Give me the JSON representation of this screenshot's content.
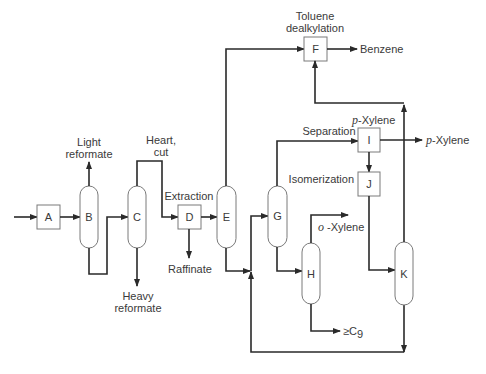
{
  "diagram": {
    "type": "process-flow",
    "units": {
      "A": "A",
      "B": "B",
      "C": "C",
      "D": "D",
      "E": "E",
      "F": "F",
      "G": "G",
      "H": "H",
      "I": "I",
      "J": "J",
      "K": "K"
    },
    "labels": {
      "light_reformate_1": "Light",
      "light_reformate_2": "reformate",
      "heart_cut_1": "Heart,",
      "heart_cut_2": "cut",
      "heavy_reformate_1": "Heavy",
      "heavy_reformate_2": "reformate",
      "extraction": "Extraction",
      "raffinate": "Raffinate",
      "toluene_dealkylation_1": "Toluene",
      "toluene_dealkylation_2": "dealkylation",
      "benzene": "Benzene",
      "separation": "Separation",
      "p_xylene_top_prefix": "p",
      "p_xylene_top_suffix": "-Xylene",
      "p_xylene_out_prefix": "p",
      "p_xylene_out_suffix": "-Xylene",
      "isomerization": "Isomerization",
      "o_xylene_prefix": "o",
      "o_xylene_suffix": " -Xylene",
      "c9": "≥C",
      "c9_sub": "9"
    }
  }
}
